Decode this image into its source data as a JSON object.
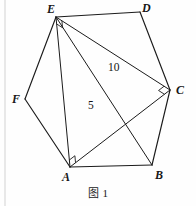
{
  "figure": {
    "caption": "图 1",
    "shape": "hexagon",
    "vertices": [
      {
        "id": "A",
        "label": "A",
        "x": 70,
        "y": 167,
        "label_x": 62,
        "label_y": 171,
        "right_angle": true
      },
      {
        "id": "B",
        "label": "B",
        "x": 152,
        "y": 165,
        "label_x": 155,
        "label_y": 169,
        "right_angle": false
      },
      {
        "id": "C",
        "label": "C",
        "x": 170,
        "y": 90,
        "label_x": 176,
        "label_y": 84,
        "right_angle": true
      },
      {
        "id": "D",
        "label": "D",
        "x": 140,
        "y": 12,
        "label_x": 142,
        "label_y": 2,
        "right_angle": false
      },
      {
        "id": "E",
        "label": "E",
        "x": 56,
        "y": 17,
        "label_x": 47,
        "label_y": 3,
        "right_angle": true
      },
      {
        "id": "F",
        "label": "F",
        "x": 25,
        "y": 99,
        "label_x": 12,
        "label_y": 93,
        "right_angle": false
      }
    ],
    "edges": [
      {
        "from": "A",
        "to": "B"
      },
      {
        "from": "B",
        "to": "C"
      },
      {
        "from": "C",
        "to": "D"
      },
      {
        "from": "D",
        "to": "E"
      },
      {
        "from": "E",
        "to": "F"
      },
      {
        "from": "F",
        "to": "A"
      }
    ],
    "diagonals": [
      {
        "from": "E",
        "to": "A",
        "name": "diagonal-EA"
      },
      {
        "from": "E",
        "to": "C",
        "name": "diagonal-EC"
      },
      {
        "from": "E",
        "to": "B",
        "name": "diagonal-EB"
      },
      {
        "from": "A",
        "to": "C",
        "name": "diagonal-AC"
      }
    ],
    "measures": [
      {
        "id": "m10",
        "text": "10",
        "x": 108,
        "y": 62,
        "on": "EC"
      },
      {
        "id": "m5",
        "text": "5",
        "x": 88,
        "y": 100,
        "on": "EB"
      }
    ],
    "colors": {
      "stroke": "#1b1b1b",
      "background": "#fefefe",
      "text": "#171717",
      "rule": "#c8c8c8"
    }
  }
}
